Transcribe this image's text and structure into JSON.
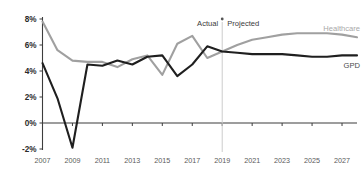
{
  "chart_data": {
    "type": "line",
    "title": "",
    "subtitle": "",
    "xlabel": "",
    "ylabel": "",
    "xlim": [
      2007,
      2028
    ],
    "ylim": [
      -2,
      8
    ],
    "ytick_labels": [
      "8%",
      "6%",
      "4%",
      "2%",
      "0%",
      "-2%"
    ],
    "ytick_values": [
      8,
      6,
      4,
      2,
      0,
      -2
    ],
    "xtick_labels": [
      "2007",
      "2009",
      "2011",
      "2013",
      "2015",
      "2017",
      "2019",
      "2021",
      "2023",
      "2025",
      "2027"
    ],
    "xtick_values": [
      2007,
      2009,
      2011,
      2013,
      2015,
      2017,
      2019,
      2021,
      2023,
      2025,
      2027
    ],
    "grid": false,
    "legend_position": "right-inline",
    "x": [
      2007,
      2008,
      2009,
      2010,
      2011,
      2012,
      2013,
      2014,
      2015,
      2016,
      2017,
      2018,
      2019,
      2020,
      2021,
      2022,
      2023,
      2024,
      2025,
      2026,
      2027,
      2028
    ],
    "series": [
      {
        "name": "Healthcare",
        "color": "#a0a0a0",
        "values": [
          7.8,
          5.6,
          4.8,
          4.7,
          4.7,
          4.3,
          4.9,
          5.2,
          3.7,
          6.1,
          6.7,
          5.0,
          5.5,
          6.0,
          6.4,
          6.6,
          6.8,
          6.9,
          6.9,
          6.9,
          6.8,
          6.6
        ]
      },
      {
        "name": "GPD",
        "color": "#1f1f1f",
        "values": [
          4.6,
          1.9,
          -1.9,
          4.5,
          4.4,
          4.8,
          4.5,
          5.1,
          5.2,
          3.6,
          4.5,
          5.9,
          5.5,
          5.4,
          5.3,
          5.3,
          5.3,
          5.2,
          5.1,
          5.1,
          5.2,
          5.2
        ]
      }
    ],
    "annotations": [
      {
        "name": "actual",
        "label": "Actual",
        "at_x": 2018
      },
      {
        "name": "projected",
        "label": "Projected",
        "at_x": 2019
      }
    ],
    "divider": {
      "label": "",
      "at_x": 2019
    }
  },
  "labels": {
    "healthcare": "Healthcare",
    "gpd": "GPD",
    "actual": "Actual",
    "projected": "Projected"
  },
  "colors": {
    "healthcare": "#a0a0a0",
    "gpd": "#1f1f1f",
    "axis": "#3d3d3d",
    "divider": "#cccccc",
    "background": "#ffffff"
  }
}
